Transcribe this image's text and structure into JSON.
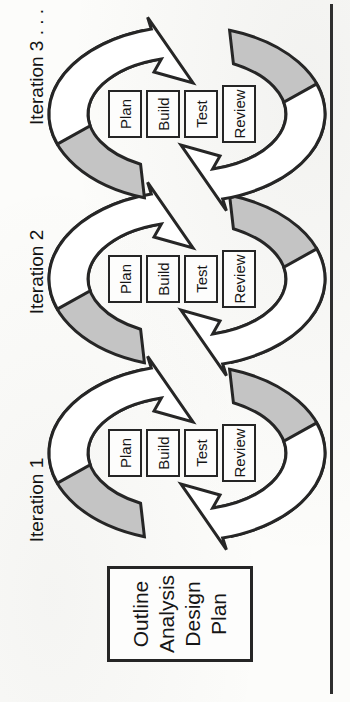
{
  "figure": {
    "phase_box": {
      "lines": [
        "Outline",
        "Analysis",
        "Design",
        "Plan"
      ]
    },
    "iterations": [
      {
        "label": "Iteration 1",
        "stages": [
          "Plan",
          "Build",
          "Test",
          "Review"
        ]
      },
      {
        "label": "Iteration 2",
        "stages": [
          "Plan",
          "Build",
          "Test",
          "Review"
        ]
      },
      {
        "label": "Iteration 3 . . .",
        "stages": [
          "Plan",
          "Build",
          "Test",
          "Review"
        ]
      }
    ],
    "colors": {
      "arrow_gray": "#c4c4c4",
      "arrow_white": "#ffffff",
      "outline": "#262626",
      "background": "#fcfcfa"
    }
  }
}
